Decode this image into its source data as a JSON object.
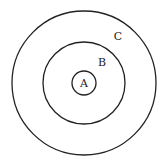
{
  "diagram": {
    "type": "concentric-circles",
    "circles": [
      {
        "name": "A",
        "label": "A",
        "cx": 84,
        "cy": 83,
        "r": 12
      },
      {
        "name": "B",
        "label": "B",
        "cx": 84,
        "cy": 83,
        "r": 41
      },
      {
        "name": "C",
        "label": "C",
        "cx": 84,
        "cy": 83,
        "r": 72
      }
    ],
    "labels": {
      "a": "A",
      "b": "B",
      "c": "C"
    }
  }
}
